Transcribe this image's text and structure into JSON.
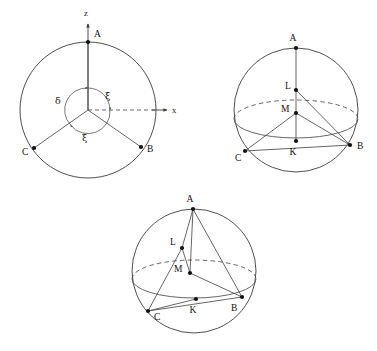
{
  "figure": {
    "title": "",
    "background_color": "#ffffff",
    "stroke_color": "#3b3b3b",
    "label_color": "#111111",
    "panel_count": 3
  },
  "panels": [
    {
      "id": "panel-1",
      "name": "reference-sphere-with-axes",
      "center": {
        "x": 88,
        "y": 110
      },
      "radius": 68,
      "axes": [
        {
          "name": "z-axis",
          "label": "z",
          "direction": "up",
          "style": "solid-arrow",
          "label_x": 86,
          "label_y": 16
        },
        {
          "name": "x-axis",
          "label": "x",
          "direction": "right",
          "style": "dashed-then-solid-arrow",
          "label_x": 172,
          "label_y": 112
        }
      ],
      "vertices": [
        {
          "label": "A",
          "x": 88,
          "y": 42,
          "label_x": 94,
          "label_y": 36
        },
        {
          "label": "B",
          "x": 141,
          "y": 147,
          "label_x": 147,
          "label_y": 152
        },
        {
          "label": "C",
          "x": 34,
          "y": 148,
          "label_x": 24,
          "label_y": 154
        }
      ],
      "radial_lines": [
        "center-A",
        "center-B",
        "center-C"
      ],
      "angles": [
        {
          "label": "δ",
          "name": "delta",
          "label_x": 57,
          "label_y": 101,
          "arrow": "ccw"
        },
        {
          "label": "ξ",
          "name": "xi-upper",
          "label_x": 107,
          "label_y": 96,
          "arrow": "cw"
        },
        {
          "label": "ξ",
          "name": "xi-lower",
          "label_x": 84,
          "label_y": 137,
          "arrow": "cw"
        }
      ],
      "angle_arc_radius": 22
    },
    {
      "id": "panel-2",
      "name": "sphere-with-inscribed-triangle-upright",
      "center": {
        "x": 296,
        "y": 110
      },
      "radius": 62,
      "equator": {
        "rx": 62,
        "ry": 19,
        "cy": 119,
        "upper_style": "dashed",
        "lower_style": "solid"
      },
      "vertices": [
        {
          "label": "A",
          "x": 296,
          "y": 48,
          "label_x": 293,
          "label_y": 41
        },
        {
          "label": "L",
          "x": 296,
          "y": 90,
          "label_x": 286,
          "label_y": 87
        },
        {
          "label": "M",
          "x": 296,
          "y": 113,
          "label_x": 284,
          "label_y": 111
        },
        {
          "label": "K",
          "x": 296,
          "y": 141,
          "label_x": 293,
          "label_y": 153
        },
        {
          "label": "B",
          "x": 350,
          "y": 145,
          "label_x": 357,
          "label_y": 148
        },
        {
          "label": "C",
          "x": 245,
          "y": 151,
          "label_x": 237,
          "label_y": 160
        }
      ],
      "chords": [
        "A-L",
        "L-M",
        "L-B",
        "M-B",
        "M-C",
        "M-K",
        "K-B",
        "C-K",
        "C-B"
      ]
    },
    {
      "id": "panel-3",
      "name": "sphere-with-inscribed-triangle-rotated",
      "center": {
        "x": 194,
        "y": 271
      },
      "radius": 62,
      "equator": {
        "rx": 62,
        "ry": 19,
        "cy": 279,
        "upper_style": "dashed",
        "lower_style": "solid"
      },
      "vertices": [
        {
          "label": "A",
          "x": 193,
          "y": 209,
          "label_x": 190,
          "label_y": 202
        },
        {
          "label": "L",
          "x": 182,
          "y": 248,
          "label_x": 172,
          "label_y": 243
        },
        {
          "label": "M",
          "x": 190,
          "y": 273,
          "label_x": 177,
          "label_y": 270
        },
        {
          "label": "K",
          "x": 196,
          "y": 299,
          "label_x": 193,
          "label_y": 311
        },
        {
          "label": "B",
          "x": 242,
          "y": 297,
          "label_x": 231,
          "label_y": 308
        },
        {
          "label": "C",
          "x": 148,
          "y": 311,
          "label_x": 155,
          "label_y": 318
        }
      ],
      "chords": [
        "A-L",
        "A-M",
        "L-M",
        "A-B",
        "M-B",
        "C-L",
        "C-K",
        "C-B",
        "K-B"
      ]
    }
  ]
}
